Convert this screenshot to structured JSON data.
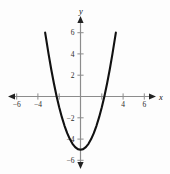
{
  "figure": {
    "name": "parabola-graph",
    "background_color": "#fdfdfd",
    "axis_color": "#8c8c8c",
    "curve_color": "#111111",
    "label_color": "#2b2b2b"
  },
  "axes": {
    "x_label": "x",
    "y_label": "y",
    "x_tick_labels": [
      "−6",
      "−4",
      "4",
      "6"
    ],
    "y_tick_labels": [
      "6",
      "4",
      "2",
      "−2",
      "−4",
      "−6"
    ]
  },
  "chart_data": {
    "type": "line",
    "title": "",
    "subtitle": "",
    "xlabel": "x",
    "ylabel": "y",
    "xlim": [
      -6.8,
      6.8
    ],
    "ylim": [
      -6.8,
      6.8
    ],
    "xticks": [
      -6,
      -4,
      -2,
      2,
      4,
      6
    ],
    "yticks": [
      -6,
      -4,
      -2,
      2,
      4,
      6
    ],
    "xtick_labels": [
      "−6",
      "−4",
      "",
      "",
      "4",
      "6"
    ],
    "ytick_labels": [
      "−6",
      "−4",
      "−2",
      "2",
      "4",
      "6"
    ],
    "grid": false,
    "legend": null,
    "series": [
      {
        "name": "y = x² − 5",
        "equation": "y = x^2 - 5",
        "vertex": [
          0,
          -5
        ],
        "roots": [
          -2.24,
          2.24
        ],
        "opens": "up",
        "x": [
          -3.32,
          -3.0,
          -2.75,
          -2.5,
          -2.24,
          -2.0,
          -1.75,
          -1.5,
          -1.25,
          -1.0,
          -0.75,
          -0.5,
          -0.25,
          0,
          0.25,
          0.5,
          0.75,
          1.0,
          1.25,
          1.5,
          1.75,
          2.0,
          2.24,
          2.5,
          2.75,
          3.0,
          3.32
        ],
        "y": [
          6.0,
          4.0,
          2.56,
          1.25,
          0.0,
          -1.0,
          -1.94,
          -2.75,
          -3.44,
          -4.0,
          -4.44,
          -4.75,
          -4.94,
          -5.0,
          -4.94,
          -4.75,
          -4.44,
          -4.0,
          -3.44,
          -2.75,
          -1.94,
          -1.0,
          0.0,
          1.25,
          2.56,
          4.0,
          6.0
        ]
      }
    ]
  }
}
